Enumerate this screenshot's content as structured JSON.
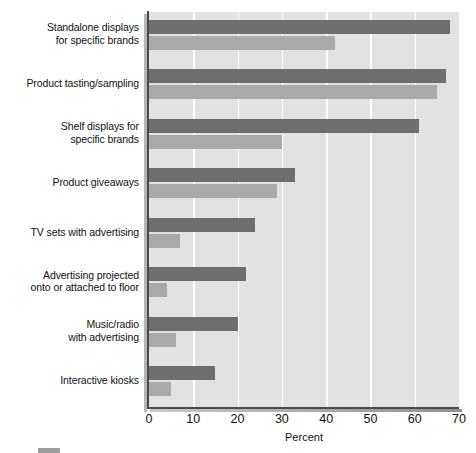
{
  "chart_data": {
    "type": "bar",
    "orientation": "horizontal",
    "title": "",
    "subtitle": "",
    "xlabel": "Percent",
    "ylabel": "",
    "xlim": [
      0,
      70
    ],
    "xticks": [
      0,
      10,
      20,
      30,
      40,
      50,
      60,
      70
    ],
    "xtick_labels": [
      "0",
      "10",
      "20",
      "30",
      "40",
      "50",
      "60",
      "70"
    ],
    "grid": "vertical-white-gridlines",
    "legend_position": "bottom-cropped",
    "categories": [
      "Standalone displays\nfor specific brands",
      "Product tasting/sampling",
      "Shelf displays for\nspecific brands",
      "Product giveaways",
      "TV sets with advertising",
      "Advertising projected\nonto or attached to floor",
      "Music/radio\nwith advertising",
      "Interactive kiosks"
    ],
    "series": [
      {
        "name": "Series 1",
        "color": "#6e6e6e",
        "values": [
          68,
          67,
          61,
          33,
          24,
          22,
          20,
          15
        ]
      },
      {
        "name": "Series 2",
        "color": "#a9a9a9",
        "values": [
          42,
          65,
          30,
          29,
          7,
          4,
          6,
          5
        ]
      }
    ]
  },
  "axis": {
    "x_axis_label": "Percent",
    "line_color": "#4a4a4a"
  },
  "colors": {
    "plot_background": "#e2e2e2",
    "gridline": "#ffffff",
    "series_dark": "#6e6e6e",
    "series_light": "#a9a9a9",
    "text": "#111111"
  },
  "legend": {
    "entries": [
      {
        "label": "",
        "color": "#9e9e9e"
      }
    ]
  }
}
